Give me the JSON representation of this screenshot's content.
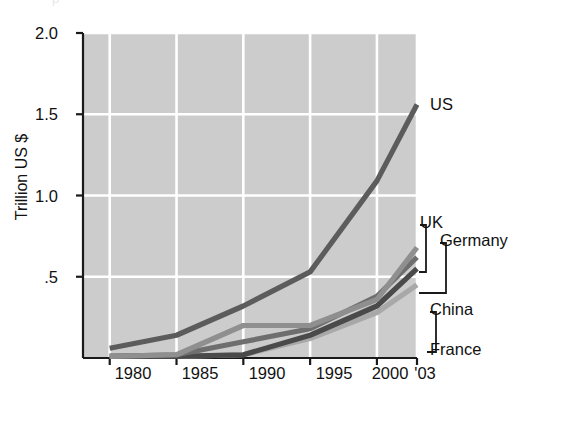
{
  "figure": {
    "cut_off_title": "p",
    "background": "#ffffff",
    "plot_background": "#cccccc",
    "gridline_color": "#ffffff",
    "axis_color": "#1a1a1a"
  },
  "chart_data": {
    "type": "line",
    "title": "",
    "xlabel": "",
    "ylabel": "Trillion US $",
    "xlim": [
      1978,
      2003
    ],
    "ylim": [
      0,
      2.0
    ],
    "grid": true,
    "legend_position": "right-inline-labels",
    "y_ticks": [
      "2.0",
      "1.5",
      "1.0",
      ".5"
    ],
    "y_tick_values": [
      2.0,
      1.5,
      1.0,
      0.5
    ],
    "x_ticks": [
      "1980",
      "1985",
      "1990",
      "1995",
      "2000",
      "'03"
    ],
    "x_tick_values": [
      1980,
      1985,
      1990,
      1995,
      2000,
      2003
    ],
    "x": [
      1980,
      1985,
      1990,
      1995,
      2000,
      2003
    ],
    "series": [
      {
        "name": "US",
        "color": "#5c5c5c",
        "values": [
          0.06,
          0.14,
          0.32,
          0.53,
          1.09,
          1.56
        ]
      },
      {
        "name": "UK",
        "color": "#8f8f8f",
        "values": [
          0.01,
          0.02,
          0.2,
          0.2,
          0.36,
          0.68
        ]
      },
      {
        "name": "Germany",
        "color": "#6e6e6e",
        "values": [
          0.01,
          0.02,
          0.1,
          0.18,
          0.38,
          0.62
        ]
      },
      {
        "name": "China",
        "color": "#4a4a4a",
        "values": [
          0.01,
          0.01,
          0.02,
          0.14,
          0.32,
          0.55
        ]
      },
      {
        "name": "France",
        "color": "#a8a8a8",
        "values": [
          0.01,
          0.01,
          0.02,
          0.12,
          0.28,
          0.45
        ]
      }
    ]
  },
  "labels": {
    "us": "US",
    "uk": "UK",
    "germany": "Germany",
    "china": "China",
    "france": "France"
  }
}
